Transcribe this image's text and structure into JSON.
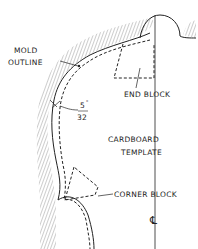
{
  "diagram": {
    "labels": {
      "mold_outline_line1": "MOLD",
      "mold_outline_line2": "OUTLINE",
      "gap_numerator": "5",
      "gap_denominator": "32",
      "gap_unit": "\"",
      "end_block": "END BLOCK",
      "cardboard_line1": "CARDBOARD",
      "cardboard_line2": "TEMPLATE",
      "corner_block": "CORNER BLOCK",
      "centerline_symbol": "℄"
    },
    "colors": {
      "ink": "#222222",
      "background": "#ffffff"
    }
  }
}
